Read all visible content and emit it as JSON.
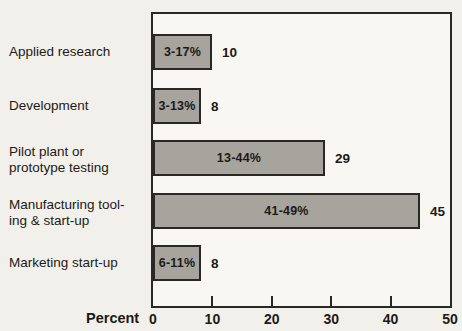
{
  "chart_data": {
    "type": "bar",
    "orientation": "horizontal",
    "title": "",
    "xlabel": "Percent",
    "xlim": [
      0,
      50
    ],
    "x_ticks": [
      0,
      10,
      20,
      30,
      40,
      50
    ],
    "grid": false,
    "legend": "none",
    "categories": [
      "Applied research",
      "Development",
      "Pilot plant or\nprototype testing",
      "Manufacturing tool-\ning & start-up",
      "Marketing start-up"
    ],
    "values": [
      10,
      8,
      29,
      45,
      8
    ],
    "bar_labels": [
      "3-17%",
      "3-13%",
      "13-44%",
      "41-49%",
      "6-11%"
    ],
    "value_labels": [
      "10",
      "8",
      "29",
      "45",
      "8"
    ],
    "colors": {
      "background": "#f2f0ea",
      "plot_background": "#f8f7f2",
      "bar_fill": "#a7a49e",
      "line": "#2a2824",
      "text": "#1c1a17"
    }
  }
}
